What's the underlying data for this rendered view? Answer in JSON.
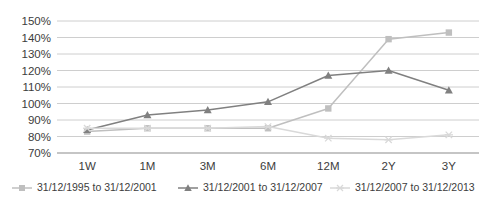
{
  "chart_data": {
    "type": "line",
    "title": "",
    "xlabel": "",
    "ylabel": "",
    "categories": [
      "1W",
      "1M",
      "3M",
      "6M",
      "12M",
      "2Y",
      "3Y"
    ],
    "ylim": [
      70,
      150
    ],
    "ytick_labels": [
      "150%",
      "140%",
      "130%",
      "120%",
      "110%",
      "100%",
      "90%",
      "80%",
      "70%"
    ],
    "ytick_values": [
      150,
      140,
      130,
      120,
      110,
      100,
      90,
      80,
      70
    ],
    "grid": true,
    "legend_position": "bottom",
    "series": [
      {
        "name": "31/12/1995 to 31/12/2001",
        "marker": "square",
        "color": "#bfbfbf",
        "values": [
          83,
          85,
          85,
          85,
          97,
          139,
          143
        ]
      },
      {
        "name": "31/12/2001 to 31/12/2007",
        "marker": "triangle",
        "color": "#808080",
        "values": [
          84,
          93,
          96,
          101,
          117,
          120,
          108
        ]
      },
      {
        "name": "31/12/2007 to 31/12/2013",
        "marker": "x",
        "color": "#d9d9d9",
        "values": [
          85,
          85,
          85,
          86,
          79,
          78,
          81
        ]
      }
    ]
  },
  "style": {
    "grid_color": "#c8c8c8",
    "axis_color": "#8c8c8c",
    "text_color": "#3c3c3c",
    "background": "#ffffff"
  }
}
